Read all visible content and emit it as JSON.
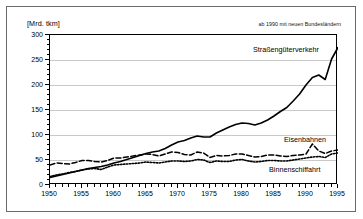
{
  "figure": {
    "unit_label": "[Mrd. tkm]",
    "note": "ab 1990 mit neuen Bundesländern"
  },
  "chart_data": {
    "type": "line",
    "title": "",
    "xlabel": "",
    "ylabel": "[Mrd. tkm]",
    "xlim": [
      1950,
      1995
    ],
    "ylim": [
      0,
      300
    ],
    "grid": true,
    "legend_position": "inline-annotations",
    "annotations": [
      "ab 1990 mit neuen Bundesländern"
    ],
    "yticks": [
      0,
      50,
      100,
      150,
      200,
      250,
      300
    ],
    "ytick_labels": [
      "0",
      "50",
      "100",
      "150",
      "200",
      "250",
      "300"
    ],
    "xticks": [
      1950,
      1955,
      1960,
      1965,
      1970,
      1975,
      1980,
      1985,
      1990,
      1995
    ],
    "xtick_labels": [
      "1950",
      "1955",
      "1960",
      "1965",
      "1970",
      "1975",
      "1980",
      "1985",
      "1990",
      "1995"
    ],
    "x": [
      1950,
      1951,
      1952,
      1953,
      1954,
      1955,
      1956,
      1957,
      1958,
      1959,
      1960,
      1961,
      1962,
      1963,
      1964,
      1965,
      1966,
      1967,
      1968,
      1969,
      1970,
      1971,
      1972,
      1973,
      1974,
      1975,
      1976,
      1977,
      1978,
      1979,
      1980,
      1981,
      1982,
      1983,
      1984,
      1985,
      1986,
      1987,
      1988,
      1989,
      1990,
      1991,
      1992,
      1993,
      1994,
      1995
    ],
    "series": [
      {
        "name": "Straßengüterverkehr",
        "style": "solid",
        "color": "#000000",
        "values": [
          15,
          18,
          21,
          24,
          27,
          30,
          33,
          35,
          37,
          40,
          44,
          47,
          51,
          55,
          59,
          63,
          66,
          68,
          73,
          80,
          86,
          89,
          94,
          98,
          96,
          96,
          104,
          110,
          116,
          121,
          124,
          123,
          120,
          124,
          130,
          138,
          147,
          155,
          168,
          182,
          200,
          215,
          220,
          211,
          252,
          275
        ]
      },
      {
        "name": "Eisenbahnen",
        "style": "dashed",
        "color": "#000000",
        "values": [
          40,
          44,
          43,
          42,
          45,
          49,
          49,
          47,
          46,
          49,
          54,
          54,
          56,
          58,
          60,
          62,
          61,
          58,
          62,
          66,
          65,
          61,
          60,
          66,
          64,
          55,
          59,
          58,
          59,
          62,
          62,
          59,
          56,
          57,
          60,
          60,
          58,
          57,
          59,
          60,
          62,
          82,
          68,
          63,
          68,
          70
        ]
      },
      {
        "name": "Binnenschiffahrt",
        "style": "dotted",
        "color": "#000000",
        "values": [
          17,
          20,
          22,
          25,
          27,
          30,
          32,
          33,
          31,
          36,
          40,
          41,
          42,
          43,
          44,
          46,
          45,
          44,
          46,
          48,
          48,
          47,
          48,
          51,
          50,
          45,
          48,
          47,
          47,
          50,
          51,
          48,
          46,
          47,
          49,
          49,
          48,
          48,
          50,
          52,
          54,
          56,
          57,
          55,
          62,
          64
        ]
      }
    ]
  }
}
